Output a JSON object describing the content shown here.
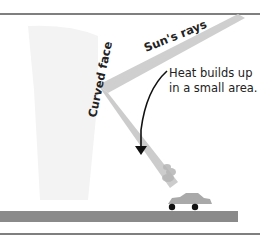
{
  "diagram": {
    "labels": {
      "curved_face": "Curved face",
      "sun_rays": "Sun's rays",
      "heat_line1": "Heat builds up",
      "heat_line2": "in a small area."
    },
    "colors": {
      "building": "#f3f3f3",
      "beam": "#c8c8c8",
      "ground": "#8a8a8a",
      "rules": "#555555",
      "car": "#a9a9a9",
      "wheels": "#111111",
      "arrow": "#111111"
    }
  }
}
